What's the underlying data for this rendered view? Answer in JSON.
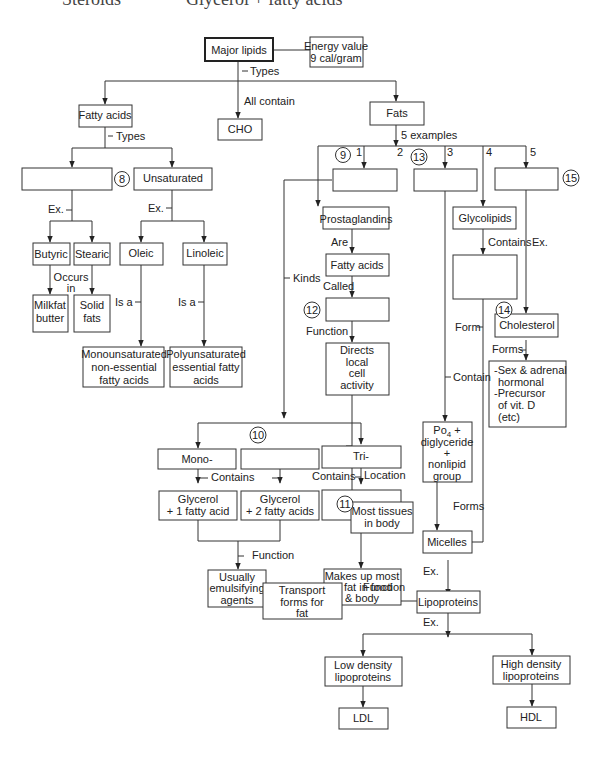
{
  "header": {
    "left_cut": "Steroids",
    "right_cut": "Glycerol + fatty acids"
  },
  "nodes": {
    "major_lipids": "Major lipids",
    "energy_line1": "Energy value",
    "energy_line2": "9 cal/gram",
    "fatty_acids": "Fatty acids",
    "cho": "CHO",
    "fats": "Fats",
    "blank8": "",
    "unsaturated": "Unsaturated",
    "butyric": "Butyric",
    "stearic": "Stearic",
    "oleic": "Oleic",
    "linoleic": "Linoleic",
    "milkfat_1": "Milkfat",
    "milkfat_2": "butter",
    "solid_1": "Solid",
    "solid_2": "fats",
    "mono_1": "Monounsaturated",
    "mono_2": "non-essential",
    "mono_3": "fatty acids",
    "poly_1": "Polyunsaturated",
    "poly_2": "essential fatty",
    "poly_3": "acids",
    "blank9": "",
    "blank13": "",
    "blank15": "",
    "prostaglandins": "Prostaglandins",
    "glycolipids": "Glycolipids",
    "fatty_acids2": "Fatty acids",
    "blank_glyco": "",
    "blank12": "",
    "cholesterol": "Cholesterol",
    "directs_1": "Directs",
    "directs_2": "local",
    "directs_3": "cell",
    "directs_4": "activity",
    "sex_1": "-Sex & adrenal",
    "sex_2": "hormonal",
    "sex_3": "-Precursor",
    "sex_4": "of vit. D",
    "sex_5": "(etc)",
    "mono_glyc": "Mono-",
    "blank10": "",
    "tri": "Tri-",
    "po4_1": "Po",
    "po4_sub": "4",
    "po4_plus": " +",
    "po4_2": "diglyceride",
    "po4_3": "+",
    "po4_4": "nonlipid",
    "po4_5": "group",
    "gly1_1": "Glycerol",
    "gly1_2": "+ 1 fatty acid",
    "gly2_1": "Glycerol",
    "gly2_2": "+ 2 fatty acids",
    "blank11": "",
    "tissues_1": "Most tissues",
    "tissues_2": "in body",
    "usually_1": "Usually",
    "usually_2": "emulsifying",
    "usually_3": "agents",
    "makes_1": "Makes up most",
    "makes_2": "of fat in food",
    "makes_3": "& body",
    "micelles": "Micelles",
    "transport_1": "Transport",
    "transport_2": "forms for",
    "transport_3": "fat",
    "lipoproteins": "Lipoproteins",
    "ldl_full_1": "Low density",
    "ldl_full_2": "lipoproteins",
    "hdl_full_1": "High density",
    "hdl_full_2": "lipoproteins",
    "ldl": "LDL",
    "hdl": "HDL"
  },
  "labels": {
    "types1": "Types",
    "all_contain": "All contain",
    "types2": "Types",
    "five_examples": "5 examples",
    "ex1": "Ex.",
    "ex2": "Ex.",
    "occurs_1": "Occurs",
    "occurs_2": "in",
    "is_a1": "Is a",
    "is_a2": "Is a",
    "kinds": "Kinds",
    "n1": "1",
    "n2": "2",
    "n3": "3",
    "n4": "4",
    "n5": "5",
    "are": "Are",
    "contains_glyco": "Contains",
    "ex_chol": "Ex.",
    "called": "Called",
    "function1": "Function",
    "form": "Form",
    "forms_chol": "Forms",
    "contain": "Contain",
    "contains_a": "Contains",
    "contains_b": "Contains",
    "location": "Location",
    "function2": "Function",
    "forms_micelles": "Forms",
    "ex_micelles": "Ex.",
    "function3": "Function",
    "ex_lipo": "Ex."
  },
  "circles": {
    "c8": "8",
    "c9": "9",
    "c10": "10",
    "c11": "11",
    "c12": "12",
    "c13": "13",
    "c14": "14",
    "c15": "15"
  }
}
